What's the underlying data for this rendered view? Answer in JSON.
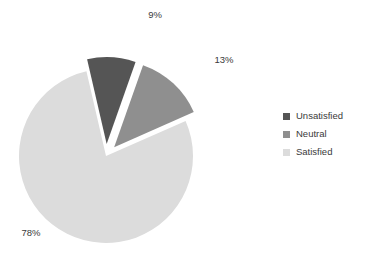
{
  "chart_data": {
    "type": "pie",
    "title": "",
    "categories": [
      "Unsatisfied",
      "Neutral",
      "Satisfied"
    ],
    "values": [
      9,
      13,
      78
    ],
    "value_labels": [
      "9%",
      "13%",
      "78%"
    ],
    "colors": [
      "#555555",
      "#8f8f8f",
      "#dcdcdc"
    ],
    "exploded": [
      true,
      true,
      false
    ],
    "legend_position": "right",
    "grid": false,
    "background": "#ffffff",
    "label_color": "#3a3a3a",
    "geometry": {
      "center_x": 106,
      "center_y": 156,
      "radius": 87,
      "start_angle_deg": -103,
      "explode_offset": 12,
      "label_radius_factor": 1.22
    },
    "label_positions": [
      {
        "text": "9%",
        "x": 155,
        "y": 18
      },
      {
        "text": "13%",
        "x": 224,
        "y": 63
      },
      {
        "text": "78%",
        "x": 31,
        "y": 236
      }
    ]
  },
  "legend": {
    "items": [
      {
        "label": "Unsatisfied",
        "color": "#555555"
      },
      {
        "label": "Neutral",
        "color": "#8f8f8f"
      },
      {
        "label": "Satisfied",
        "color": "#dcdcdc"
      }
    ]
  }
}
